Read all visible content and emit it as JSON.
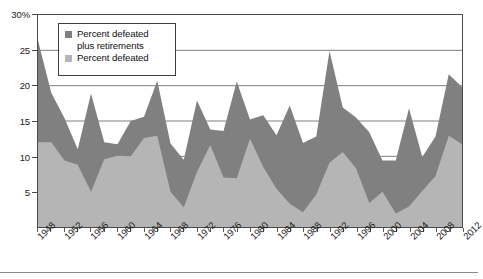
{
  "chart_data": {
    "type": "area",
    "title": "",
    "subtitle": "",
    "xlabel": "",
    "ylabel": "",
    "grid": true,
    "legend_position": "top-left-inside",
    "ylim": [
      0,
      30
    ],
    "y_ticks": [
      0,
      5,
      10,
      15,
      20,
      25,
      30
    ],
    "y_tick_labels": [
      "0",
      "5",
      "10",
      "15",
      "20",
      "25",
      "30%"
    ],
    "x": [
      1948,
      1950,
      1952,
      1954,
      1956,
      1958,
      1960,
      1962,
      1964,
      1966,
      1968,
      1970,
      1972,
      1974,
      1976,
      1978,
      1980,
      1982,
      1984,
      1986,
      1988,
      1990,
      1992,
      1994,
      1996,
      1998,
      2000,
      2002,
      2004,
      2006,
      2008,
      2010,
      2012
    ],
    "x_tick_labels": [
      "1948",
      "1952",
      "1956",
      "1960",
      "1964",
      "1968",
      "1972",
      "1976",
      "1980",
      "1984",
      "1988",
      "1992",
      "1996",
      "2000",
      "2004",
      "2008",
      "2012"
    ],
    "x_tick_step_years": 4,
    "series": [
      {
        "name": "Percent defeated plus retirements",
        "color": "#808080",
        "values": [
          26.4,
          19.0,
          15.4,
          11.0,
          18.9,
          12.0,
          11.7,
          15.0,
          15.6,
          20.7,
          11.8,
          9.5,
          17.9,
          13.8,
          13.6,
          20.6,
          15.2,
          15.8,
          13.0,
          17.2,
          11.9,
          12.8,
          24.9,
          16.9,
          15.5,
          13.4,
          9.4,
          9.4,
          16.8,
          9.9,
          12.8,
          21.6,
          19.8
        ]
      },
      {
        "name": "Percent defeated",
        "color": "#b5b5b5",
        "values": [
          12.0,
          12.0,
          9.4,
          8.8,
          5.0,
          9.6,
          10.1,
          10.0,
          12.6,
          12.9,
          5.0,
          2.8,
          7.8,
          11.6,
          7.0,
          6.9,
          12.5,
          8.5,
          5.4,
          3.3,
          2.1,
          4.6,
          9.1,
          10.6,
          8.3,
          3.4,
          5.0,
          1.9,
          2.9,
          5.1,
          7.2,
          12.9,
          11.7
        ]
      }
    ]
  },
  "legend": {
    "items": [
      {
        "label_line1": "Percent defeated",
        "label_line2": "plus retirements",
        "color": "#808080"
      },
      {
        "label_line1": "Percent defeated",
        "label_line2": "",
        "color": "#b5b5b5"
      }
    ]
  },
  "colors": {
    "dark_series": "#808080",
    "light_series": "#b5b5b5",
    "axis": "#4a4a4a",
    "grid": "#6e6e6e",
    "text": "#1a1a1a",
    "background": "#ffffff"
  }
}
